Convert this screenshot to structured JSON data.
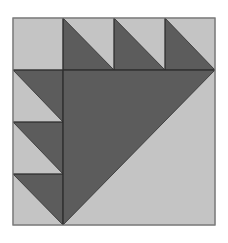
{
  "block": {
    "name": "Bear's Paw style quilt block",
    "colors": {
      "light": "#c4c4c4",
      "dark": "#5c5c5c",
      "line": "#2e2e2e",
      "border": "#8a8a8a"
    },
    "bounds": {
      "x0": 13,
      "y0": 18,
      "x1": 215,
      "y1": 225
    },
    "grid": {
      "cols": [
        13,
        63,
        114,
        165,
        215
      ],
      "rows": [
        18,
        70,
        122,
        174,
        225
      ]
    }
  }
}
